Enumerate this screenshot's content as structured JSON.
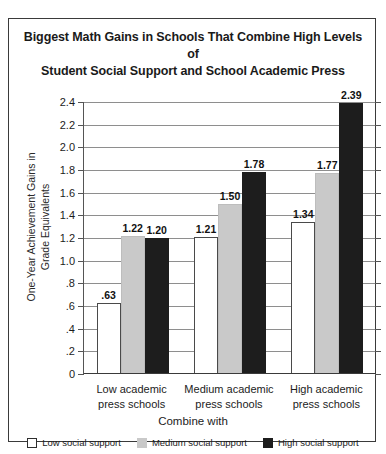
{
  "chart_data": {
    "type": "bar",
    "title": "Biggest Math Gains in Schools That Combine High Levels of Student Social Support and School Academic Press",
    "title_line1": "Biggest Math Gains in Schools That Combine High Levels of",
    "title_line2": "Student Social Support and School Academic Press",
    "xlabel": "Combine with",
    "ylabel": "One-Year Achievement Gains in Grade Equivalents",
    "ylabel_line1": "One-Year Achievement Gains in",
    "ylabel_line2": "Grade Equivalents",
    "categories": [
      "Low academic press schools",
      "Medium academic press schools",
      "High academic press schools"
    ],
    "category_lines": [
      {
        "l1": "Low academic",
        "l2": "press schools"
      },
      {
        "l1": "Medium academic",
        "l2": "press schools"
      },
      {
        "l1": "High academic",
        "l2": "press schools"
      }
    ],
    "series": [
      {
        "name": "Low social support",
        "color": "#ffffff",
        "values": [
          0.63,
          1.21,
          1.34
        ],
        "labels": [
          ".63",
          "1.21",
          "1.34"
        ]
      },
      {
        "name": "Medium social support",
        "color": "#c9c9c9",
        "values": [
          1.22,
          1.5,
          1.77
        ],
        "labels": [
          "1.22",
          "1.50",
          "1.77"
        ]
      },
      {
        "name": "High social support",
        "color": "#1d1d1d",
        "values": [
          1.2,
          1.78,
          2.39
        ],
        "labels": [
          "1.20",
          "1.78",
          "2.39"
        ]
      }
    ],
    "ylim": [
      0,
      2.4
    ],
    "ytick_values": [
      0,
      0.2,
      0.4,
      0.6,
      0.8,
      1.0,
      1.2,
      1.4,
      1.6,
      1.8,
      2.0,
      2.2,
      2.4
    ],
    "ytick_labels": [
      "0",
      ".2",
      ".4",
      ".6",
      ".8",
      "1.0",
      "1.2",
      "1.4",
      "1.6",
      "1.8",
      "2.0",
      "2.2",
      "2.4"
    ],
    "grid": true,
    "legend_position": "bottom"
  },
  "legend": [
    {
      "label": "Low social support",
      "swatch": "low"
    },
    {
      "label": "Medium social support",
      "swatch": "med"
    },
    {
      "label": "High social support",
      "swatch": "high"
    }
  ]
}
